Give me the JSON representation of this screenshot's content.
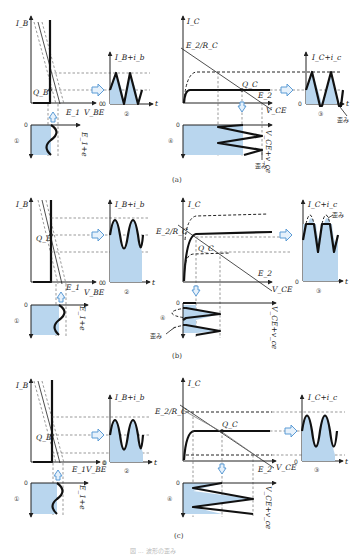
{
  "figure": {
    "caption": "図 ... 波形の歪み",
    "colors": {
      "fill": "#b9d6ee",
      "arrow": "#5b9bd5",
      "ink": "#111111"
    },
    "panels": [
      {
        "id": "a",
        "label": "(a)",
        "input_char": {
          "y_axis": "I_B",
          "x_axis": "V_BE",
          "origin": "0",
          "q_point": "Q_B",
          "e_label": "E_1"
        },
        "input_wave": {
          "num": "①",
          "label": "E_1+e",
          "zero": "0",
          "t": "t"
        },
        "base_wave": {
          "num": "②",
          "label": "I_B+i_b",
          "zero": "0",
          "t": "t"
        },
        "output_char": {
          "y_axis": "I_C",
          "x_axis": "V_CE",
          "intercept_y": "E_2/R_C",
          "intercept_x": "E_2",
          "q_point": "Q_C"
        },
        "collector_wave": {
          "num": "③",
          "label": "I_C+i_c",
          "zero": "0",
          "t": "t",
          "distortion": "歪み"
        },
        "vce_wave": {
          "num": "④",
          "label": "V_CE+v_ce",
          "zero": "0",
          "t": "t",
          "distortion": "歪み"
        }
      },
      {
        "id": "b",
        "label": "(b)",
        "input_char": {
          "y_axis": "I_B",
          "x_axis": "V_BE",
          "origin": "0",
          "q_point": "Q_B",
          "e_label": "E_1"
        },
        "input_wave": {
          "num": "①",
          "label": "E_1+e",
          "zero": "0",
          "t": "t"
        },
        "base_wave": {
          "num": "②",
          "label": "I_B+i_b",
          "zero": "0",
          "t": "t"
        },
        "output_char": {
          "y_axis": "I_C",
          "x_axis": "V_CE",
          "intercept_y": "E_2/R_C",
          "intercept_x": "E_2",
          "q_point": "Q_C"
        },
        "collector_wave": {
          "num": "③",
          "label": "I_C+i_c",
          "zero": "0",
          "t": "t",
          "distortion": "歪み"
        },
        "vce_wave": {
          "num": "④",
          "label": "V_CE+v_ce",
          "zero": "0",
          "t": "t",
          "distortion": "歪み"
        }
      },
      {
        "id": "c",
        "label": "(c)",
        "input_char": {
          "y_axis": "I_B",
          "x_axis": "V_BE",
          "origin": "0",
          "q_point": "Q_B",
          "e_label": "E_1"
        },
        "input_wave": {
          "num": "①",
          "label": "E_1+e",
          "zero": "0",
          "t": "t"
        },
        "base_wave": {
          "num": "②",
          "label": "I_B+i_b",
          "zero": "0",
          "t": "t"
        },
        "output_char": {
          "y_axis": "I_C",
          "x_axis": "V_CE",
          "intercept_y": "E_2/R_C",
          "intercept_x": "E_2",
          "q_point": "Q_C"
        },
        "collector_wave": {
          "num": "③",
          "label": "I_C+i_c",
          "zero": "0",
          "t": "t"
        },
        "vce_wave": {
          "num": "④",
          "label": "V_CE+v_ce",
          "zero": "0",
          "t": "t"
        }
      }
    ]
  }
}
